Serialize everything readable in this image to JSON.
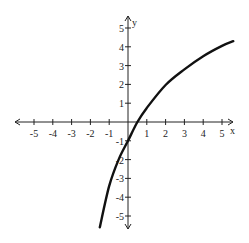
{
  "chart_data": {
    "type": "line",
    "title": "",
    "xlabel": "x",
    "ylabel": "y",
    "xlim": [
      -5.5,
      5.5
    ],
    "ylim": [
      -5.5,
      5.5
    ],
    "xticks": [
      -5,
      -4,
      -3,
      -2,
      -1,
      1,
      2,
      3,
      4,
      5
    ],
    "yticks": [
      -5,
      -4,
      -3,
      -2,
      -1,
      1,
      2,
      3,
      4,
      5
    ],
    "grid": false,
    "legend": null,
    "series": [
      {
        "name": "curve",
        "x": [
          -1.5,
          -1.0,
          -0.5,
          0.0,
          0.5,
          1.0,
          2.0,
          3.0,
          4.0,
          5.0,
          5.6
        ],
        "y": [
          -5.6,
          -3.4,
          -2.0,
          -1.0,
          0.0,
          0.75,
          1.97,
          2.8,
          3.5,
          4.05,
          4.3
        ]
      }
    ]
  },
  "layout": {
    "origin_px": [
      128,
      122
    ],
    "unit_px": 18.8,
    "x_axis_px": [
      15,
      233
    ],
    "y_axis_px": [
      16,
      229
    ]
  }
}
